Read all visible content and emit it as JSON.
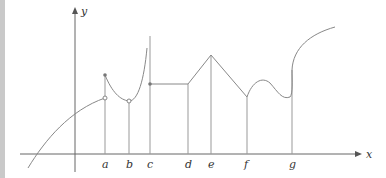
{
  "diagram": {
    "axes": {
      "x_label": "x",
      "y_label": "y"
    },
    "ticks": [
      {
        "id": "a",
        "label": "a"
      },
      {
        "id": "b",
        "label": "b"
      },
      {
        "id": "c",
        "label": "c"
      },
      {
        "id": "d",
        "label": "d"
      },
      {
        "id": "e",
        "label": "e"
      },
      {
        "id": "f",
        "label": "f"
      },
      {
        "id": "g",
        "label": "g"
      }
    ],
    "colors": {
      "curve": "#888888",
      "axis": "#666666",
      "sidebar": "#c9c9c9"
    }
  }
}
